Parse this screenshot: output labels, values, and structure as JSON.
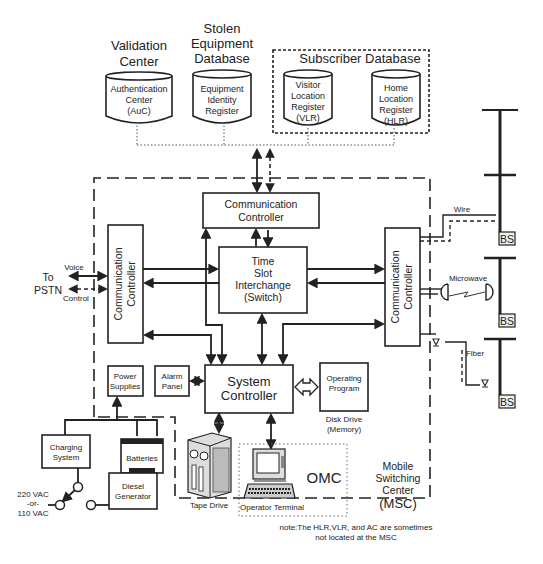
{
  "databases": {
    "validation_center": {
      "title": [
        "Validation",
        "Center"
      ],
      "cylinder": [
        "Authentication",
        "Center",
        "(AuC)"
      ]
    },
    "stolen_equipment": {
      "title": [
        "Stolen",
        "Equipment",
        "Database"
      ],
      "cylinder": [
        "Equipment",
        "Identity",
        "Register"
      ]
    },
    "subscriber": {
      "title": "Subscriber Database",
      "vlr": [
        "Visitor",
        "Location",
        "Register",
        "(VLR)"
      ],
      "hlr": [
        "Home",
        "Location",
        "Register",
        "(HLR)"
      ]
    }
  },
  "msc": {
    "top_comm_controller": [
      "Communication",
      "Controller"
    ],
    "left_comm_controller": [
      "Communication",
      "Controller"
    ],
    "right_comm_controller": [
      "Communication",
      "Controller"
    ],
    "tsi": [
      "Time",
      "Slot",
      "Interchange",
      "(Switch)"
    ],
    "system_controller": [
      "System",
      "Controller"
    ],
    "power_supplies": [
      "Power",
      "Supplies"
    ],
    "alarm_panel": [
      "Alarm",
      "Panel"
    ],
    "operating_program": [
      "Operating",
      "Program"
    ],
    "disk_drive": [
      "Disk Drive",
      "(Memory)"
    ],
    "label": [
      "Mobile",
      "Switching",
      "Center",
      "(MSC)"
    ]
  },
  "pstn": {
    "label": [
      "To",
      "PSTN"
    ],
    "voice": "Voice",
    "control": "Control"
  },
  "links": {
    "wire": "Wire",
    "microwave": "Microwave",
    "fiber": "Fiber"
  },
  "base_stations": [
    "BS",
    "BS",
    "BS"
  ],
  "power": {
    "charging_system": [
      "Charging",
      "System"
    ],
    "batteries": "Batteries",
    "diesel_generator": [
      "Diesel",
      "Generator"
    ],
    "ac_input": [
      "220 VAC",
      "-or-",
      "110 VAC"
    ]
  },
  "omc": {
    "label": "OMC",
    "operator_terminal": "Operator Terminal",
    "tape_drive": "Tape Drive"
  },
  "note": [
    "note:The HLR,VLR, and AC are sometimes",
    "not located at the MSC"
  ]
}
